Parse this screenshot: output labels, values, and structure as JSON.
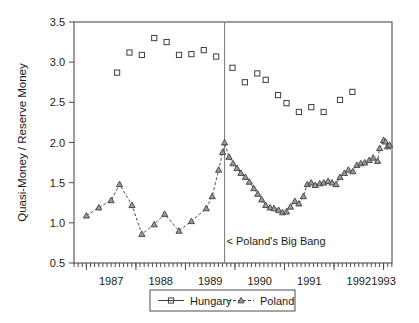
{
  "chart_data": {
    "type": "scatter",
    "title": "",
    "xlabel": "",
    "ylabel": "Quasi-Money / Reserve Money",
    "xlim": [
      1986.75,
      1993.17
    ],
    "ylim": [
      0.5,
      3.5
    ],
    "yticks": [
      "0.5",
      "1.0",
      "1.5",
      "2.0",
      "2.5",
      "3.0",
      "3.5"
    ],
    "ytick_values": [
      0.5,
      1.0,
      1.5,
      2.0,
      2.5,
      3.0,
      3.5
    ],
    "xticks": [
      "1987",
      "1988",
      "1989",
      "1990",
      "1991",
      "1992",
      "1993"
    ],
    "xtick_values": [
      1987.5,
      1988.5,
      1989.5,
      1990.5,
      1991.5,
      1992.5,
      1993.0
    ],
    "minor_tick_interval": 0.0833,
    "grid": false,
    "legend_position": "below-center",
    "annotations": [
      {
        "text": "< Poland's Big Bang",
        "x": 1989.83,
        "y": 0.72
      }
    ],
    "event_lines": [
      {
        "name": "polands-big-bang",
        "x": 1989.79,
        "color": "#808080"
      }
    ],
    "series": [
      {
        "name": "Hungary",
        "marker": "square",
        "line": "solid",
        "color": "#3f3f3f",
        "points": [
          {
            "x": 1987.62,
            "y": 2.87
          },
          {
            "x": 1987.87,
            "y": 3.12
          },
          {
            "x": 1988.12,
            "y": 3.09
          },
          {
            "x": 1988.37,
            "y": 3.3
          },
          {
            "x": 1988.62,
            "y": 3.25
          },
          {
            "x": 1988.87,
            "y": 3.09
          },
          {
            "x": 1989.12,
            "y": 3.1
          },
          {
            "x": 1989.37,
            "y": 3.15
          },
          {
            "x": 1989.62,
            "y": 3.07
          },
          {
            "x": 1989.95,
            "y": 2.93
          },
          {
            "x": 1990.2,
            "y": 2.75
          },
          {
            "x": 1990.45,
            "y": 2.86
          },
          {
            "x": 1990.62,
            "y": 2.78
          },
          {
            "x": 1990.87,
            "y": 2.59
          },
          {
            "x": 1991.04,
            "y": 2.49
          },
          {
            "x": 1991.29,
            "y": 2.38
          },
          {
            "x": 1991.54,
            "y": 2.44
          },
          {
            "x": 1991.79,
            "y": 2.38
          },
          {
            "x": 1992.12,
            "y": 2.53
          },
          {
            "x": 1992.37,
            "y": 2.63
          }
        ]
      },
      {
        "name": "Poland",
        "marker": "triangle",
        "line": "dashed",
        "color": "#3f3f3f",
        "points": [
          {
            "x": 1987.0,
            "y": 1.09
          },
          {
            "x": 1987.25,
            "y": 1.19
          },
          {
            "x": 1987.5,
            "y": 1.28
          },
          {
            "x": 1987.67,
            "y": 1.48
          },
          {
            "x": 1987.92,
            "y": 1.22
          },
          {
            "x": 1988.12,
            "y": 0.86
          },
          {
            "x": 1988.37,
            "y": 0.98
          },
          {
            "x": 1988.58,
            "y": 1.11
          },
          {
            "x": 1988.87,
            "y": 0.9
          },
          {
            "x": 1989.12,
            "y": 1.02
          },
          {
            "x": 1989.42,
            "y": 1.18
          },
          {
            "x": 1989.54,
            "y": 1.33
          },
          {
            "x": 1989.67,
            "y": 1.66
          },
          {
            "x": 1989.75,
            "y": 1.88
          },
          {
            "x": 1989.79,
            "y": 2.0
          },
          {
            "x": 1989.88,
            "y": 1.82
          },
          {
            "x": 1989.96,
            "y": 1.74
          },
          {
            "x": 1990.04,
            "y": 1.68
          },
          {
            "x": 1990.12,
            "y": 1.62
          },
          {
            "x": 1990.21,
            "y": 1.57
          },
          {
            "x": 1990.29,
            "y": 1.51
          },
          {
            "x": 1990.38,
            "y": 1.43
          },
          {
            "x": 1990.46,
            "y": 1.36
          },
          {
            "x": 1990.54,
            "y": 1.29
          },
          {
            "x": 1990.62,
            "y": 1.22
          },
          {
            "x": 1990.71,
            "y": 1.19
          },
          {
            "x": 1990.79,
            "y": 1.18
          },
          {
            "x": 1990.88,
            "y": 1.16
          },
          {
            "x": 1990.96,
            "y": 1.13
          },
          {
            "x": 1991.04,
            "y": 1.14
          },
          {
            "x": 1991.12,
            "y": 1.2
          },
          {
            "x": 1991.21,
            "y": 1.27
          },
          {
            "x": 1991.29,
            "y": 1.24
          },
          {
            "x": 1991.38,
            "y": 1.33
          },
          {
            "x": 1991.46,
            "y": 1.48
          },
          {
            "x": 1991.54,
            "y": 1.5
          },
          {
            "x": 1991.62,
            "y": 1.47
          },
          {
            "x": 1991.71,
            "y": 1.49
          },
          {
            "x": 1991.79,
            "y": 1.5
          },
          {
            "x": 1991.88,
            "y": 1.52
          },
          {
            "x": 1991.96,
            "y": 1.5
          },
          {
            "x": 1992.04,
            "y": 1.48
          },
          {
            "x": 1992.12,
            "y": 1.57
          },
          {
            "x": 1992.21,
            "y": 1.62
          },
          {
            "x": 1992.29,
            "y": 1.66
          },
          {
            "x": 1992.38,
            "y": 1.64
          },
          {
            "x": 1992.46,
            "y": 1.72
          },
          {
            "x": 1992.54,
            "y": 1.74
          },
          {
            "x": 1992.62,
            "y": 1.75
          },
          {
            "x": 1992.71,
            "y": 1.78
          },
          {
            "x": 1992.79,
            "y": 1.81
          },
          {
            "x": 1992.88,
            "y": 1.77
          },
          {
            "x": 1992.92,
            "y": 1.93
          },
          {
            "x": 1993.0,
            "y": 2.03
          },
          {
            "x": 1993.04,
            "y": 2.01
          },
          {
            "x": 1993.08,
            "y": 1.95
          },
          {
            "x": 1993.12,
            "y": 1.97
          }
        ]
      }
    ],
    "legend": [
      {
        "label": "Hungary",
        "marker": "square",
        "line": "solid"
      },
      {
        "label": "Poland",
        "marker": "triangle",
        "line": "dashed"
      }
    ]
  }
}
